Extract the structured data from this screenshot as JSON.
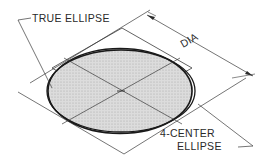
{
  "diagram": {
    "labels": {
      "true_ellipse": "TRUE ELLIPSE",
      "dia": "DIA",
      "four_center_line1": "4-CENTER",
      "four_center_line2": "ELLIPSE"
    },
    "colors": {
      "line": "#3a3a3a",
      "ellipse_outline": "#1a1a1a",
      "fill": "#d4d4d4",
      "background": "#ffffff"
    }
  }
}
